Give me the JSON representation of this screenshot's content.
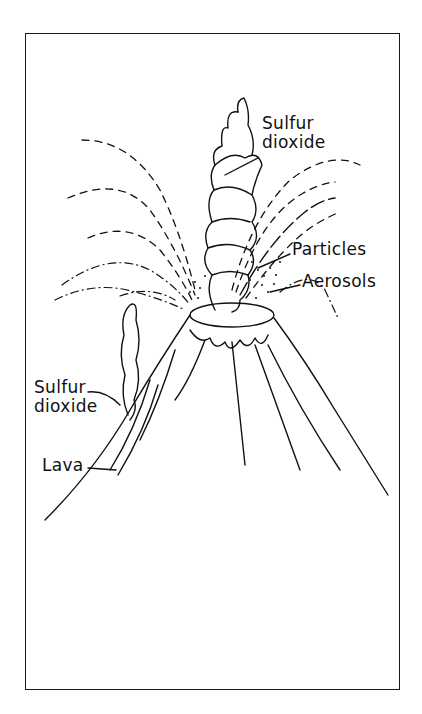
{
  "figure": {
    "type": "illustration",
    "labels": [
      {
        "id": "sulfur-dioxide-top",
        "text": "Sulfur\ndioxide"
      },
      {
        "id": "particles",
        "text": "Particles"
      },
      {
        "id": "aerosols",
        "text": "Aerosols"
      },
      {
        "id": "sulfur-dioxide-left",
        "text": "Sulfur\ndioxide"
      },
      {
        "id": "lava",
        "text": "Lava"
      }
    ],
    "colors": {
      "ink": "#111111",
      "background": "#ffffff"
    }
  }
}
